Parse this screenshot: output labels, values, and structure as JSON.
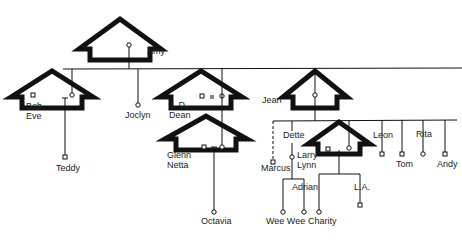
{
  "diagram": {
    "type": "family-genogram",
    "colors": {
      "ink": "#111111",
      "background": "#ffffff"
    },
    "households": [
      {
        "id": "amy-house",
        "members": [
          "Amy"
        ]
      },
      {
        "id": "bob-eve-house",
        "members": [
          "Bob",
          "Eve",
          "Teddy"
        ]
      },
      {
        "id": "jd-dean-house",
        "members": [
          "J. D.",
          "Dean"
        ]
      },
      {
        "id": "glenn-netta-house",
        "members": [
          "Glenn",
          "Netta",
          "Octavia"
        ]
      },
      {
        "id": "jean-house",
        "members": [
          "Jean"
        ]
      },
      {
        "id": "larry-lynn-house",
        "members": [
          "Larry",
          "Lynn",
          "Charity",
          "L.A."
        ]
      }
    ],
    "labels": {
      "amy": "Amy",
      "bob": "Bob",
      "eve": "Eve",
      "teddy": "Teddy",
      "joclyn": "Joclyn",
      "jd": "J. D.",
      "dean": "Dean",
      "glenn": "Glenn",
      "netta": "Netta",
      "octavia": "Octavia",
      "jean": "Jean",
      "dette": "Dette",
      "marcus": "Marcus",
      "larry": "Larry",
      "lynn": "Lynn",
      "adrian": "Adrian",
      "weewee": "Wee Wee",
      "charity": "Charity",
      "la": "L.A.",
      "leon": "Leon",
      "tom": "Tom",
      "rita": "Rita",
      "andy": "Andy"
    },
    "legend_symbols": {
      "male": "square",
      "female": "circle",
      "marriage": "=",
      "dashed_line": "non-marital/uncertain relation"
    }
  }
}
